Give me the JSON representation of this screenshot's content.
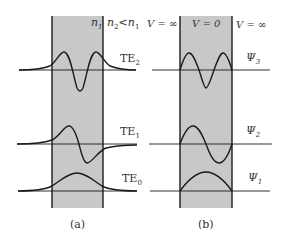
{
  "panels": [
    {
      "id": "a",
      "caption": "(a)",
      "header": {
        "n1": "n",
        "n1_sub": "1",
        "n2": "n",
        "n2_sub": "2",
        "relation": "<",
        "n1b": "n",
        "n1b_sub": "1"
      },
      "modes": [
        {
          "label": "TE",
          "sub": "2"
        },
        {
          "label": "TE",
          "sub": "1"
        },
        {
          "label": "TE",
          "sub": "0"
        }
      ]
    },
    {
      "id": "b",
      "caption": "(b)",
      "header": {
        "left": "V = ∞",
        "center": "V = 0",
        "right": "V = ∞"
      },
      "modes": [
        {
          "label": "Ψ",
          "sub": "3"
        },
        {
          "label": "Ψ",
          "sub": "2"
        },
        {
          "label": "Ψ",
          "sub": "1"
        }
      ]
    }
  ],
  "colors": {
    "slab": "#c8c8c8",
    "line": "#1a1a1a"
  }
}
